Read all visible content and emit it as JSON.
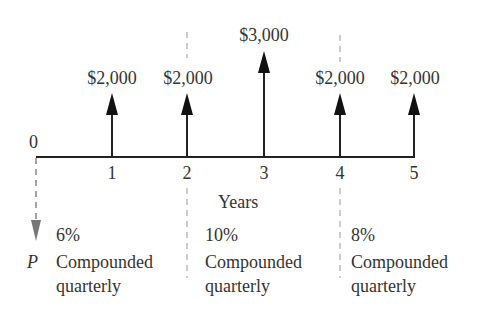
{
  "diagram": {
    "type": "cash-flow-diagram",
    "origin_label": "0",
    "axis_label": "Years",
    "present_value_label": "P",
    "periods": [
      "1",
      "2",
      "3",
      "4",
      "5"
    ],
    "cash_flows": [
      {
        "year": "1",
        "amount": "$2,000"
      },
      {
        "year": "2",
        "amount": "$2,000"
      },
      {
        "year": "3",
        "amount": "$3,000"
      },
      {
        "year": "4",
        "amount": "$2,000"
      },
      {
        "year": "5",
        "amount": "$2,000"
      }
    ],
    "rate_segments": [
      {
        "rate": "6%",
        "line1": "Compounded",
        "line2": "quarterly"
      },
      {
        "rate": "10%",
        "line1": "Compounded",
        "line2": "quarterly"
      },
      {
        "rate": "8%",
        "line1": "Compounded",
        "line2": "quarterly"
      }
    ],
    "colors": {
      "line": "#222222",
      "dashed": "#888888",
      "text": "#333333",
      "p_arrow": "#777777"
    }
  }
}
